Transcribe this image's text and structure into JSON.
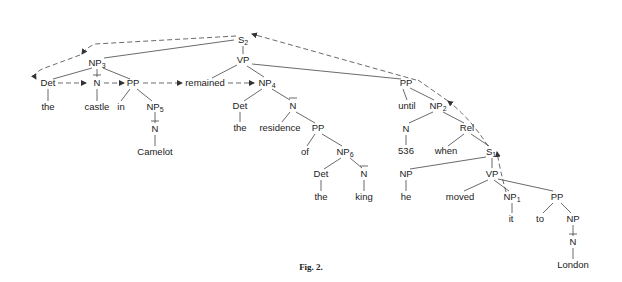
{
  "figure": {
    "caption": "Fig. 2.",
    "type": "syntactic-parse-tree",
    "sentence": "the castle in Camelot remained the residence of the king until 536 when he moved it to London"
  },
  "nodes": {
    "S2": {
      "label": "S",
      "sub": "2"
    },
    "VP_main": {
      "label": "VP"
    },
    "NP3": {
      "label": "NP",
      "sub": "3"
    },
    "Det_1": {
      "label": "Det"
    },
    "the_1": {
      "label": "the"
    },
    "N_castle": {
      "label": "N"
    },
    "castle": {
      "label": "castle"
    },
    "PP_in": {
      "label": "PP"
    },
    "in": {
      "label": "in"
    },
    "NP5": {
      "label": "NP",
      "sub": "5"
    },
    "N_camelot": {
      "label": "N"
    },
    "Camelot": {
      "label": "Camelot"
    },
    "remained": {
      "label": "remained"
    },
    "NP4": {
      "label": "NP",
      "sub": "4"
    },
    "Det_2": {
      "label": "Det"
    },
    "the_2": {
      "label": "the"
    },
    "N_residence": {
      "label": "N"
    },
    "residence": {
      "label": "residence"
    },
    "PP_of": {
      "label": "PP"
    },
    "of": {
      "label": "of"
    },
    "NP6": {
      "label": "NP",
      "sub": "6"
    },
    "Det_3": {
      "label": "Det"
    },
    "the_3": {
      "label": "the"
    },
    "N_king": {
      "label": "N"
    },
    "king": {
      "label": "king"
    },
    "PP_until": {
      "label": "PP"
    },
    "until": {
      "label": "until"
    },
    "NP2": {
      "label": "NP",
      "sub": "2"
    },
    "N_536": {
      "label": "N"
    },
    "num_536": {
      "label": "536"
    },
    "Rel": {
      "label": "Rel"
    },
    "when": {
      "label": "when"
    },
    "S1": {
      "label": "S",
      "sub": "1"
    },
    "NP_he": {
      "label": "NP"
    },
    "he": {
      "label": "he"
    },
    "VP_moved": {
      "label": "VP"
    },
    "moved": {
      "label": "moved"
    },
    "NP1": {
      "label": "NP",
      "sub": "1"
    },
    "it": {
      "label": "it"
    },
    "PP_to": {
      "label": "PP"
    },
    "to": {
      "label": "to"
    },
    "NP_london": {
      "label": "NP"
    },
    "N_london": {
      "label": "N"
    },
    "London": {
      "label": "London"
    }
  }
}
